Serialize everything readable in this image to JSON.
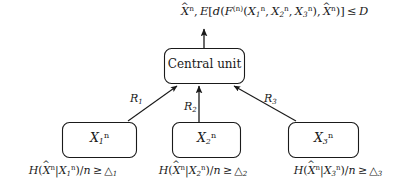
{
  "figure": {
    "type": "block-diagram",
    "background_color": "#ffffff",
    "line_color": "#1a1a1a"
  },
  "top_formula": {
    "id": "distortion-constraint",
    "plain": "X̂ⁿ, E[d(F⁽ⁿ⁾(X₁ⁿ, X₂ⁿ, X₃ⁿ), X̂ⁿ)] ≤ D",
    "parts": {
      "output_symbol": "X",
      "output_sup": "n",
      "expectation": "E",
      "distortion_fn": "d",
      "encoder_fn": "F",
      "encoder_sup": "(n)",
      "arg1": "X",
      "arg1_sub": "1",
      "arg1_sup": "n",
      "arg2": "X",
      "arg2_sub": "2",
      "arg2_sup": "n",
      "arg3": "X",
      "arg3_sub": "3",
      "arg3_sup": "n",
      "relation": "≤",
      "bound": "D"
    }
  },
  "central_node": {
    "id": "central-unit",
    "label": "Central unit",
    "shape": "rounded-rectangle"
  },
  "source_nodes": [
    {
      "id": "source-1",
      "symbol": "X",
      "sub": "1",
      "sup": "n",
      "plain": "X₁ⁿ"
    },
    {
      "id": "source-2",
      "symbol": "X",
      "sub": "2",
      "sup": "n",
      "plain": "X₂ⁿ"
    },
    {
      "id": "source-3",
      "symbol": "X",
      "sub": "3",
      "sup": "n",
      "plain": "X₃ⁿ"
    }
  ],
  "rate_labels": [
    {
      "id": "rate-1",
      "symbol": "R",
      "sub": "1",
      "plain": "R₁"
    },
    {
      "id": "rate-2",
      "symbol": "R",
      "sub": "2",
      "plain": "R₂"
    },
    {
      "id": "rate-3",
      "symbol": "R",
      "sub": "3",
      "plain": "R₃"
    }
  ],
  "constraints": [
    {
      "id": "entropy-constraint-1",
      "plain": "H(X̂ⁿ|X₁ⁿ)/n ≥ △₁",
      "entropy": "H",
      "cond_symbol": "X",
      "cond_sub": "1",
      "cond_sup": "n",
      "divisor": "n",
      "relation": "≥",
      "threshold_symbol": "△",
      "threshold_sub": "1"
    },
    {
      "id": "entropy-constraint-2",
      "plain": "H(X̂ⁿ|X₂ⁿ)/n ≥ △₂",
      "entropy": "H",
      "cond_symbol": "X",
      "cond_sub": "2",
      "cond_sup": "n",
      "divisor": "n",
      "relation": "≥",
      "threshold_symbol": "△",
      "threshold_sub": "2"
    },
    {
      "id": "entropy-constraint-3",
      "plain": "H(X̂ⁿ|X₃ⁿ)/n ≥ △₃",
      "entropy": "H",
      "cond_symbol": "X",
      "cond_sub": "3",
      "cond_sup": "n",
      "divisor": "n",
      "relation": "≥",
      "threshold_symbol": "△",
      "threshold_sub": "3"
    }
  ],
  "edges": [
    {
      "id": "edge-source1-to-central",
      "from": "source-1",
      "to": "central-unit",
      "label": "R₁"
    },
    {
      "id": "edge-source2-to-central",
      "from": "source-2",
      "to": "central-unit",
      "label": "R₂"
    },
    {
      "id": "edge-source3-to-central",
      "from": "source-3",
      "to": "central-unit",
      "label": "R₃"
    },
    {
      "id": "edge-central-to-output",
      "from": "central-unit",
      "to": "distortion-constraint",
      "label": ""
    }
  ]
}
